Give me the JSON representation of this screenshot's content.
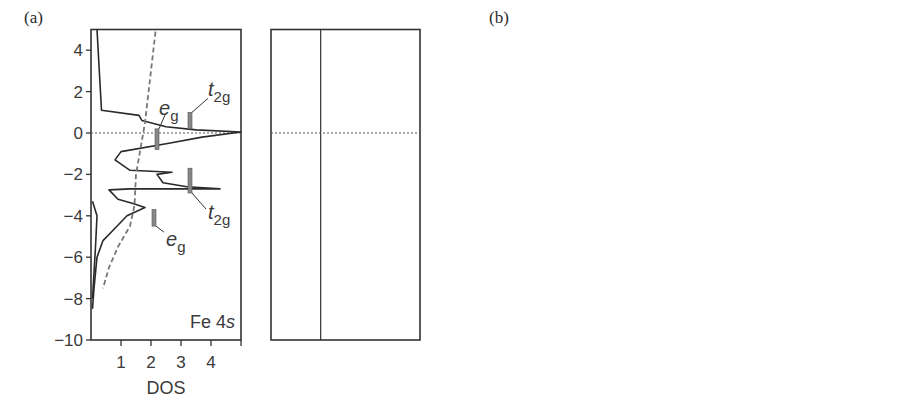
{
  "figure": {
    "panel_a_label": "(a)",
    "panel_b_label": "(b)",
    "y_axis_title": "Energy (eV)",
    "fermi_label": "ε",
    "fermi_sub": "F"
  },
  "chart_data": [
    {
      "type": "line",
      "panel": "(a) left",
      "title": "Fe 4s",
      "xlabel": "DOS",
      "ylabel": "Energy (eV)",
      "xlim": [
        0,
        5
      ],
      "ylim": [
        -10,
        5
      ],
      "xticks": [
        1,
        2,
        3,
        4
      ],
      "yticks": [
        4,
        2,
        0,
        -2,
        -4,
        -6,
        -8,
        -10
      ],
      "fermi_level": 0,
      "series": [
        {
          "name": "Fe 4s DOS",
          "style": "solid",
          "points": [
            [
              0.2,
              5
            ],
            [
              0.35,
              1.1
            ],
            [
              1.6,
              0.85
            ],
            [
              1.7,
              0.6
            ],
            [
              2.5,
              0.3
            ],
            [
              3.5,
              0.15
            ],
            [
              5,
              0.05
            ],
            [
              3.7,
              -0.2
            ],
            [
              2.6,
              -0.5
            ],
            [
              1.0,
              -0.9
            ],
            [
              0.8,
              -1.3
            ],
            [
              1.3,
              -1.8
            ],
            [
              2.7,
              -1.9
            ],
            [
              2.2,
              -2.0
            ],
            [
              2.4,
              -2.4
            ],
            [
              3.2,
              -2.6
            ],
            [
              4.3,
              -2.7
            ],
            [
              1.3,
              -2.7
            ],
            [
              0.6,
              -2.75
            ],
            [
              0.9,
              -3.2
            ],
            [
              1.4,
              -3.4
            ],
            [
              1.8,
              -3.6
            ],
            [
              1.2,
              -4.0
            ],
            [
              0.8,
              -4.6
            ],
            [
              0.4,
              -5.2
            ],
            [
              0.2,
              -6
            ],
            [
              0.1,
              -7.5
            ],
            [
              0.05,
              -8.5
            ]
          ]
        },
        {
          "name": "Fe 4s inner (near zero)",
          "style": "solid",
          "points": [
            [
              0.05,
              -3.3
            ],
            [
              0.2,
              -4.0
            ],
            [
              0.15,
              -5.5
            ],
            [
              0.05,
              -8
            ]
          ]
        },
        {
          "name": "free-electron-like",
          "style": "dashed",
          "points": [
            [
              2.15,
              4.9
            ],
            [
              1.8,
              0.5
            ],
            [
              1.5,
              -2
            ],
            [
              1.45,
              -3.5
            ],
            [
              1.3,
              -4.5
            ],
            [
              0.9,
              -5.5
            ],
            [
              0.6,
              -6.5
            ],
            [
              0.4,
              -7.5
            ]
          ]
        }
      ],
      "annotations": [
        {
          "text": "e_g",
          "x": 2.2,
          "y_range": [
            0.2,
            -0.8
          ]
        },
        {
          "text": "t_2g",
          "x": 3.3,
          "y_range": [
            1.0,
            0.2
          ]
        },
        {
          "text": "t_2g",
          "x": 3.3,
          "y_range": [
            -1.7,
            -2.9
          ]
        },
        {
          "text": "e_g",
          "x": 2.1,
          "y_range": [
            -3.7,
            -4.5
          ]
        }
      ]
    },
    {
      "type": "line",
      "panel": "(a) right",
      "title": "Fe–Fe",
      "xlabel": "−COHP",
      "xlim": [
        -0.4,
        0.8
      ],
      "ylim": [
        -10,
        5
      ],
      "xticks": [
        -0.4,
        0,
        0.4,
        0.8
      ],
      "fermi_level": 0,
      "series": [
        {
          "name": "Fe–Fe −COHP",
          "style": "solid",
          "points": [
            [
              0.01,
              5
            ],
            [
              0.01,
              1.2
            ],
            [
              0.0,
              0.9
            ],
            [
              -0.1,
              0.7
            ],
            [
              -0.05,
              0.5
            ],
            [
              -0.1,
              0.3
            ],
            [
              -0.2,
              0.05
            ],
            [
              -0.15,
              -0.1
            ],
            [
              -0.05,
              -0.3
            ],
            [
              0.05,
              -0.8
            ],
            [
              0.1,
              -1.2
            ],
            [
              0.2,
              -1.5
            ],
            [
              0.3,
              -1.7
            ],
            [
              0.45,
              -1.8
            ],
            [
              0.4,
              -1.95
            ],
            [
              0.5,
              -2.2
            ],
            [
              0.65,
              -2.4
            ],
            [
              0.75,
              -2.7
            ],
            [
              0.3,
              -2.75
            ],
            [
              -0.05,
              -2.8
            ],
            [
              0.1,
              -3.0
            ],
            [
              0.2,
              -3.3
            ],
            [
              0.35,
              -3.6
            ],
            [
              0.45,
              -3.8
            ],
            [
              0.35,
              -4.0
            ],
            [
              0.3,
              -4.4
            ],
            [
              0.25,
              -4.5
            ],
            [
              0.15,
              -5.2
            ],
            [
              0.08,
              -6.2
            ],
            [
              0.03,
              -7.3
            ],
            [
              0.0,
              -8.5
            ]
          ]
        }
      ],
      "annotations": [
        {
          "text": "e_g",
          "x": 0.32,
          "y_range": [
            0.0,
            -1.0
          ]
        },
        {
          "text": "t_2g",
          "x": 0.55,
          "y_range": [
            1.0,
            0.2
          ]
        },
        {
          "text": "t_2g",
          "x": 0.55,
          "y_range": [
            -1.7,
            -2.9
          ]
        },
        {
          "text": "e_g",
          "x": 0.32,
          "y_range": [
            -3.6,
            -4.5
          ]
        }
      ]
    },
    {
      "type": "line",
      "panel": "(b) left",
      "title": "",
      "xlabel": "DOS",
      "ylabel": "Energy (eV)",
      "xlim": [
        -2.5,
        2.5
      ],
      "ylim": [
        -10,
        5
      ],
      "xticks": [
        2,
        1,
        0,
        1,
        2
      ],
      "fermi_level": 0,
      "legend": [
        "β (spin down, dashed, left)",
        "α (spin up, solid, right)"
      ],
      "series": [
        {
          "name": "β",
          "style": "dashed",
          "side": "left",
          "points": [
            [
              -0.1,
              4.9
            ],
            [
              -0.15,
              3
            ],
            [
              -0.4,
              2.5
            ],
            [
              -0.8,
              2.0
            ],
            [
              -1.5,
              1.7
            ],
            [
              -2.4,
              1.6
            ],
            [
              -1.4,
              1.5
            ],
            [
              -1.1,
              1.2
            ],
            [
              -0.6,
              0.9
            ],
            [
              -0.3,
              0.6
            ],
            [
              -0.2,
              0.1
            ],
            [
              -0.4,
              -0.2
            ],
            [
              -0.9,
              -0.6
            ],
            [
              -1.0,
              -1.0
            ],
            [
              -0.8,
              -1.3
            ],
            [
              -1.0,
              -1.7
            ],
            [
              -0.4,
              -1.75
            ],
            [
              -0.2,
              -2.1
            ],
            [
              -0.3,
              -2.7
            ],
            [
              -0.5,
              -3.1
            ],
            [
              -0.3,
              -3.6
            ],
            [
              -0.15,
              -4.2
            ],
            [
              -0.05,
              -5
            ],
            [
              -0.02,
              -6
            ]
          ]
        },
        {
          "name": "α",
          "style": "solid",
          "side": "right",
          "points": [
            [
              0.05,
              5
            ],
            [
              0.05,
              0.3
            ],
            [
              0.5,
              0.15
            ],
            [
              0.7,
              0.0
            ],
            [
              0.7,
              -0.3
            ],
            [
              1.2,
              -0.5
            ],
            [
              2.4,
              -0.6
            ],
            [
              2.1,
              -0.75
            ],
            [
              1.3,
              -1.1
            ],
            [
              0.6,
              -1.6
            ],
            [
              0.5,
              -2.0
            ],
            [
              1.0,
              -2.2
            ],
            [
              1.4,
              -2.4
            ],
            [
              1.0,
              -2.6
            ],
            [
              1.1,
              -3.0
            ],
            [
              1.6,
              -3.2
            ],
            [
              0.3,
              -3.3
            ],
            [
              0.4,
              -3.6
            ],
            [
              1.0,
              -4.0
            ],
            [
              0.5,
              -4.5
            ],
            [
              0.3,
              -5.0
            ],
            [
              0.1,
              -5.7
            ],
            [
              0.05,
              -7
            ],
            [
              0.0,
              -8.5
            ]
          ]
        }
      ],
      "annotations": [
        {
          "text": "β",
          "x": -1.3,
          "y": 3.1
        },
        {
          "text": "α",
          "x": 1.35,
          "y": 3.1
        }
      ]
    },
    {
      "type": "line",
      "panel": "(b) right",
      "title": "Fe–Fe",
      "xlabel": "−COHP",
      "xlim": [
        -0.2,
        0.5
      ],
      "ylim": [
        -10,
        5
      ],
      "xticks": [
        -0.2,
        0,
        0.2,
        0.4
      ],
      "fermi_level": 0,
      "series": [
        {
          "name": "α",
          "style": "solid",
          "points": [
            [
              0.01,
              5
            ],
            [
              0.01,
              0.3
            ],
            [
              -0.01,
              0.0
            ],
            [
              0.0,
              -0.2
            ],
            [
              -0.05,
              -0.5
            ],
            [
              -0.06,
              -0.8
            ],
            [
              -0.02,
              -1.0
            ],
            [
              0.03,
              -1.3
            ],
            [
              0.06,
              -1.6
            ],
            [
              0.1,
              -1.9
            ],
            [
              0.15,
              -2.3
            ],
            [
              0.12,
              -2.6
            ],
            [
              0.17,
              -2.8
            ],
            [
              0.24,
              -3.2
            ],
            [
              0.05,
              -3.4
            ],
            [
              0.18,
              -3.7
            ],
            [
              0.22,
              -4.0
            ],
            [
              0.17,
              -4.2
            ],
            [
              0.15,
              -4.6
            ],
            [
              0.09,
              -4.8
            ],
            [
              0.06,
              -5.5
            ],
            [
              0.03,
              -6.5
            ],
            [
              0.0,
              -7.5
            ]
          ]
        },
        {
          "name": "β",
          "style": "dashed",
          "points": [
            [
              0.0,
              4.9
            ],
            [
              0.0,
              3.0
            ],
            [
              -0.07,
              2.4
            ],
            [
              -0.07,
              1.8
            ],
            [
              -0.13,
              1.2
            ],
            [
              -0.1,
              0.9
            ],
            [
              0.0,
              0.4
            ],
            [
              0.02,
              0.0
            ],
            [
              0.12,
              -0.3
            ],
            [
              0.25,
              -0.7
            ],
            [
              0.3,
              -1.0
            ],
            [
              0.42,
              -1.5
            ],
            [
              0.35,
              -1.7
            ],
            [
              0.06,
              -1.75
            ],
            [
              0.08,
              -2.1
            ],
            [
              0.18,
              -2.5
            ],
            [
              0.25,
              -2.8
            ],
            [
              0.21,
              -3.1
            ],
            [
              0.12,
              -3.5
            ],
            [
              0.1,
              -3.8
            ],
            [
              0.07,
              -4.6
            ],
            [
              0.04,
              -5.5
            ],
            [
              0.02,
              -6.5
            ]
          ]
        }
      ],
      "annotations": [
        {
          "text": "β",
          "x": 0.34,
          "y": -0.4
        },
        {
          "text": "α",
          "x": 0.24,
          "y": -4.7
        }
      ]
    }
  ]
}
